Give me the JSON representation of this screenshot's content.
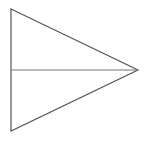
{
  "figure": {
    "canvas": {
      "width": 148,
      "height": 142,
      "background_color": "#ffffff"
    },
    "style": {
      "edge_color": "#555555",
      "median_color": "#767676",
      "fill_color": "#ffffff",
      "stroke_width": 1.2
    },
    "vertices": {
      "top_left": {
        "label": "A",
        "x": 11,
        "y": 9
      },
      "bottom_left": {
        "label": "B",
        "x": 11,
        "y": 131
      },
      "right_apex": {
        "label": "C",
        "x": 138,
        "y": 70
      },
      "left_midpoint": {
        "label": "M",
        "x": 11,
        "y": 70
      }
    },
    "edges": [
      {
        "name": "left-vertical-edge",
        "from": "A",
        "to": "B",
        "kind": "outline"
      },
      {
        "name": "upper-diagonal-edge",
        "from": "A",
        "to": "C",
        "kind": "outline"
      },
      {
        "name": "lower-diagonal-edge",
        "from": "B",
        "to": "C",
        "kind": "outline"
      },
      {
        "name": "horizontal-median",
        "from": "M",
        "to": "C",
        "kind": "median"
      }
    ],
    "regions": [
      {
        "name": "upper-sub-triangle",
        "vertices": [
          "A",
          "M",
          "C"
        ]
      },
      {
        "name": "lower-sub-triangle",
        "vertices": [
          "M",
          "B",
          "C"
        ]
      }
    ],
    "paths": {
      "outline": "M 11 9 L 138 70 L 11 131 Z",
      "median": "M 11 70 L 138 70"
    }
  }
}
